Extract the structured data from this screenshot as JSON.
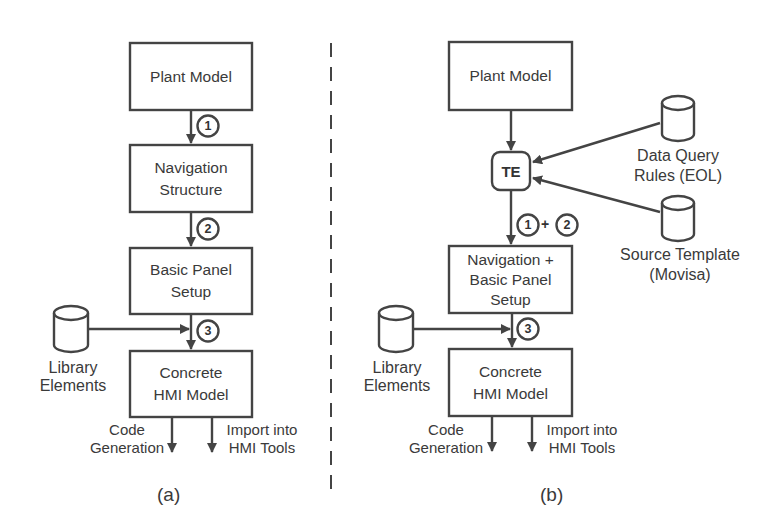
{
  "diagram_a": {
    "caption": "(a)",
    "boxes": {
      "plant_model": "Plant Model",
      "nav_structure_l1": "Navigation",
      "nav_structure_l2": "Structure",
      "basic_panel_l1": "Basic Panel",
      "basic_panel_l2": "Setup",
      "concrete_l1": "Concrete",
      "concrete_l2": "HMI Model"
    },
    "steps": [
      "1",
      "2",
      "3"
    ],
    "library": {
      "l1": "Library",
      "l2": "Elements"
    },
    "outputs": {
      "code_gen_l1": "Code",
      "code_gen_l2": "Generation",
      "import_l1": "Import into",
      "import_l2": "HMI Tools"
    }
  },
  "diagram_b": {
    "caption": "(b)",
    "boxes": {
      "plant_model": "Plant Model",
      "te": "TE",
      "nav_basic_l1": "Navigation +",
      "nav_basic_l2": "Basic Panel",
      "nav_basic_l3": "Setup",
      "concrete_l1": "Concrete",
      "concrete_l2": "HMI Model"
    },
    "steps": {
      "one": "1",
      "plus": "+",
      "two": "2",
      "three": "3"
    },
    "data_query": {
      "l1": "Data Query",
      "l2": "Rules (EOL)"
    },
    "source_template": {
      "l1": "Source Template",
      "l2": "(Movisa)"
    },
    "library": {
      "l1": "Library",
      "l2": "Elements"
    },
    "outputs": {
      "code_gen_l1": "Code",
      "code_gen_l2": "Generation",
      "import_l1": "Import into",
      "import_l2": "HMI Tools"
    }
  },
  "colors": {
    "stroke": "#444444",
    "text": "#3a3a3a",
    "background": "#ffffff"
  }
}
